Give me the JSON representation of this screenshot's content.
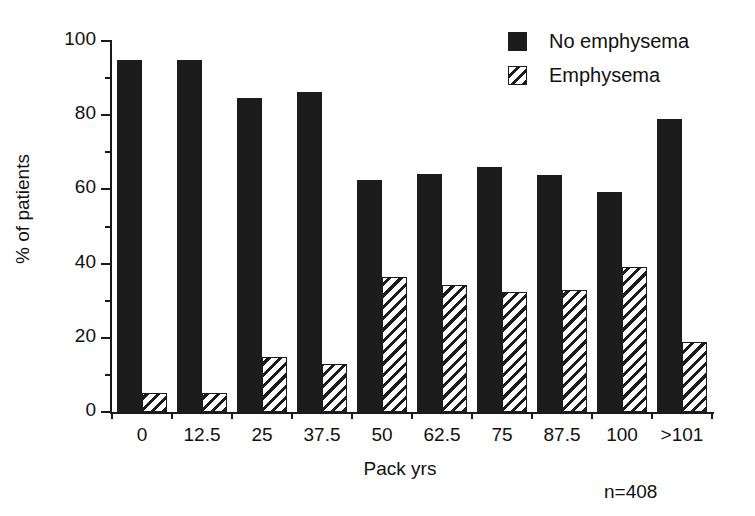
{
  "chart_data": {
    "type": "bar",
    "title": "",
    "subtitle": "",
    "xlabel": "Pack yrs",
    "ylabel": "% of patients",
    "categories": [
      "0",
      "12.5",
      "25",
      "37.5",
      "50",
      "62.5",
      "75",
      "87.5",
      "100",
      ">101"
    ],
    "series": [
      {
        "name": "No emphysema",
        "pattern": "solid-black",
        "color": "#1c1c1c",
        "values": [
          95,
          95,
          84.6,
          86.2,
          62.5,
          64.1,
          66,
          64,
          59.2,
          79
        ]
      },
      {
        "name": "Emphysema",
        "pattern": "diagonal-hatch",
        "color": "#1c1c1c",
        "values": [
          5,
          5,
          14.8,
          13,
          36.5,
          34.3,
          32.4,
          33,
          39,
          18.8
        ]
      }
    ],
    "ylim": [
      0,
      100
    ],
    "y_ticks": [
      0,
      20,
      40,
      60,
      80,
      100
    ],
    "y_tick_labels": [
      "0",
      "20",
      "40",
      "60",
      "80",
      "100"
    ],
    "y_minor_ticks": [
      10,
      30,
      50,
      70,
      90
    ],
    "grid": false,
    "legend_position": "top-right",
    "annotations": [
      {
        "name": "sample-size",
        "text": "n=408"
      }
    ]
  },
  "legend": {
    "items": [
      {
        "label": "No emphysema"
      },
      {
        "label": "Emphysema"
      }
    ]
  },
  "axes": {
    "y_title": "% of patients",
    "x_title": "Pack yrs"
  },
  "footnote": {
    "sample_size": "n=408"
  }
}
